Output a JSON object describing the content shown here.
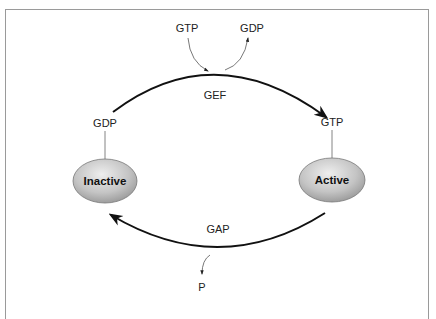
{
  "diagram": {
    "type": "cycle",
    "nodes": [
      {
        "id": "inactive",
        "label": "Inactive",
        "bound": "GDP"
      },
      {
        "id": "active",
        "label": "Active",
        "bound": "GTP"
      }
    ],
    "edges": [
      {
        "from": "inactive",
        "to": "active",
        "label": "GEF",
        "inputs": [
          "GTP"
        ],
        "outputs": [
          "GDP"
        ]
      },
      {
        "from": "active",
        "to": "inactive",
        "label": "GAP",
        "outputs": [
          "P"
        ]
      }
    ]
  },
  "labels": {
    "exchange_in": "GTP",
    "exchange_out": "GDP",
    "gef": "GEF",
    "gap": "GAP",
    "inactive_bound": "GDP",
    "active_bound": "GTP",
    "inactive_node": "Inactive",
    "active_node": "Active",
    "phosphate": "P"
  },
  "colors": {
    "frame": "#9a9a9a",
    "arrow": "#111111",
    "thin_line": "#555555",
    "node_fill_light": "#e6e6e6",
    "node_fill_dark": "#9e9e9e"
  }
}
